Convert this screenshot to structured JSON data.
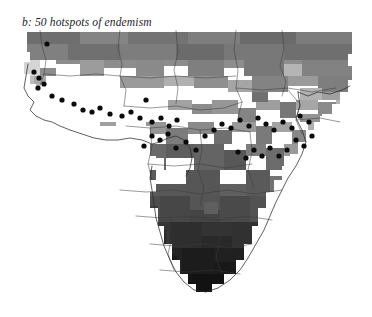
{
  "panel": {
    "label": "b",
    "title": "b: 50 hotspots of endemism"
  },
  "figure": {
    "background_color": "#ffffff",
    "region": "Sub-Saharan Africa",
    "dot_color": "#0b0b0b",
    "border_color": "#3a3a3a",
    "coast_color": "#2b2b2b"
  },
  "chart_data": {
    "type": "heatmap",
    "title": "b: 50 hotspots of endemism",
    "xlabel": "",
    "ylabel": "",
    "grid": false,
    "legend": "none",
    "cell_size_px": 8,
    "value_encoding": "grayscale, light = low, dark = high",
    "grayscale_levels": [
      {
        "name": "level-0",
        "color": "#ffffff"
      },
      {
        "name": "level-1",
        "color": "#d9d9d9"
      },
      {
        "name": "level-2",
        "color": "#bdbdbd"
      },
      {
        "name": "level-3",
        "color": "#9e9e9e"
      },
      {
        "name": "level-4",
        "color": "#808080"
      },
      {
        "name": "level-5",
        "color": "#666666"
      },
      {
        "name": "level-6",
        "color": "#4a4a4a"
      },
      {
        "name": "level-7",
        "color": "#303030"
      },
      {
        "name": "level-8",
        "color": "#1c1c1c"
      },
      {
        "name": "level-9",
        "color": "#101010"
      }
    ],
    "hotspot_count": 50,
    "hotspots": [
      [
        47,
        44
      ],
      [
        34,
        72
      ],
      [
        39,
        78
      ],
      [
        44,
        84
      ],
      [
        38,
        88
      ],
      [
        52,
        96
      ],
      [
        62,
        100
      ],
      [
        74,
        104
      ],
      [
        83,
        110
      ],
      [
        92,
        112
      ],
      [
        100,
        108
      ],
      [
        110,
        114
      ],
      [
        122,
        116
      ],
      [
        131,
        112
      ],
      [
        140,
        118
      ],
      [
        152,
        122
      ],
      [
        161,
        118
      ],
      [
        146,
        100
      ],
      [
        169,
        126
      ],
      [
        177,
        120
      ],
      [
        152,
        136
      ],
      [
        160,
        140
      ],
      [
        168,
        134
      ],
      [
        144,
        146
      ],
      [
        176,
        148
      ],
      [
        186,
        142
      ],
      [
        196,
        150
      ],
      [
        205,
        136
      ],
      [
        214,
        130
      ],
      [
        222,
        124
      ],
      [
        231,
        128
      ],
      [
        240,
        120
      ],
      [
        249,
        126
      ],
      [
        258,
        118
      ],
      [
        266,
        124
      ],
      [
        274,
        130
      ],
      [
        283,
        122
      ],
      [
        292,
        128
      ],
      [
        300,
        116
      ],
      [
        309,
        122
      ],
      [
        296,
        140
      ],
      [
        304,
        146
      ],
      [
        312,
        136
      ],
      [
        287,
        150
      ],
      [
        279,
        156
      ],
      [
        270,
        148
      ],
      [
        262,
        156
      ],
      [
        254,
        150
      ],
      [
        246,
        158
      ],
      [
        238,
        152
      ]
    ]
  }
}
